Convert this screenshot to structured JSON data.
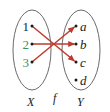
{
  "figure": {
    "type": "mapping-diagram",
    "caption": "",
    "domain": {
      "name": "X",
      "elements": [
        {
          "label": "1",
          "color": "#1a1a1a",
          "x": 30,
          "y": 26
        },
        {
          "label": "2",
          "color": "#3f8f5f",
          "x": 30,
          "y": 44
        },
        {
          "label": "3",
          "color": "#3f8f5f",
          "x": 30,
          "y": 62
        }
      ],
      "ellipse": {
        "cx": 32,
        "cy": 50,
        "rx": 19,
        "ry": 40
      }
    },
    "codomain": {
      "name": "Y",
      "elements": [
        {
          "label": "a",
          "color": "#1a1a1a",
          "x": 79,
          "y": 26
        },
        {
          "label": "b",
          "color": "#1a1a1a",
          "x": 79,
          "y": 44
        },
        {
          "label": "c",
          "color": "#1a1a1a",
          "x": 79,
          "y": 62
        },
        {
          "label": "d",
          "color": "#1a1a1a",
          "x": 79,
          "y": 80
        }
      ],
      "ellipse": {
        "cx": 81,
        "cy": 50,
        "rx": 19,
        "ry": 40
      }
    },
    "function_label": "f",
    "arrow_color": "#c0392b",
    "ellipse_color": "#6b6b6b",
    "dot_color": "#1a1a1a",
    "arrows": [
      {
        "from": "1",
        "to": "c",
        "x1": 32,
        "y1": 26,
        "x2": 76,
        "y2": 62
      },
      {
        "from": "2",
        "to": "b",
        "x1": 32,
        "y1": 44,
        "x2": 76,
        "y2": 44
      },
      {
        "from": "3",
        "to": "a",
        "x1": 32,
        "y1": 62,
        "x2": 76,
        "y2": 26
      }
    ],
    "unmapped_codomain_elements": [
      "d"
    ]
  }
}
